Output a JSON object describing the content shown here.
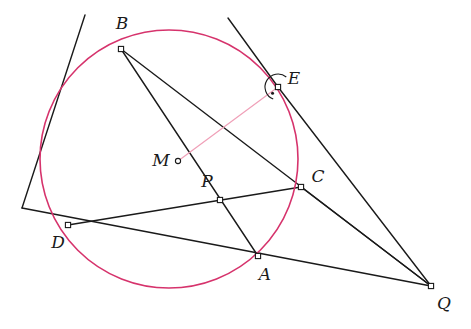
{
  "figure": {
    "kind": "euclidean-geometry-diagram",
    "width": 471,
    "height": 329,
    "background_color": "#ffffff"
  },
  "colors": {
    "circle_stroke": "#d6336c",
    "line_stroke": "#1a1a1a",
    "highlight_stroke": "#f0a0b8",
    "label_color": "#1a1a1a",
    "marker_fill": "#ffffff"
  },
  "circle": {
    "name": "main-circle",
    "cx": 169,
    "cy": 159,
    "r": 129,
    "stroke_width": 1.6
  },
  "points": [
    {
      "id": "B",
      "label": "B",
      "x": 121,
      "y": 49,
      "label_x": 122,
      "label_y": 24,
      "marker": "square-open"
    },
    {
      "id": "E",
      "label": "E",
      "x": 278,
      "y": 87,
      "label_x": 294,
      "label_y": 79,
      "marker": "square-open"
    },
    {
      "id": "C",
      "label": "C",
      "x": 301,
      "y": 187,
      "label_x": 318,
      "label_y": 177,
      "marker": "square-open"
    },
    {
      "id": "P",
      "label": "P",
      "x": 220,
      "y": 200,
      "label_x": 207,
      "label_y": 182,
      "marker": "square-open"
    },
    {
      "id": "M",
      "label": "M",
      "x": 178,
      "y": 161,
      "label_x": 161,
      "label_y": 161,
      "marker": "circle-open"
    },
    {
      "id": "D",
      "label": "D",
      "x": 68,
      "y": 225,
      "label_x": 58,
      "label_y": 243,
      "marker": "square-open"
    },
    {
      "id": "A",
      "label": "A",
      "x": 258,
      "y": 256,
      "label_x": 265,
      "label_y": 275,
      "marker": "square-open"
    },
    {
      "id": "Q",
      "label": "Q",
      "x": 431,
      "y": 286,
      "label_x": 444,
      "label_y": 304,
      "marker": "square-open"
    }
  ],
  "segments": [
    {
      "name": "line-tangent-through-B-and-D",
      "from": [
        85,
        15
      ],
      "to": [
        22,
        208
      ],
      "style": "solid-black",
      "note": "line entering top-left through B"
    },
    {
      "name": "line-B-to-Q-through-E",
      "from": [
        121,
        49
      ],
      "to": [
        431,
        286
      ],
      "style": "solid-black"
    },
    {
      "name": "line-B-to-A",
      "from": [
        121,
        49
      ],
      "to": [
        258,
        256
      ],
      "style": "solid-black"
    },
    {
      "name": "line-E-upper-extension",
      "from": [
        228,
        18
      ],
      "to": [
        278,
        87
      ],
      "style": "solid-black"
    },
    {
      "name": "line-E-to-Q",
      "from": [
        278,
        87
      ],
      "to": [
        431,
        286
      ],
      "style": "solid-black"
    },
    {
      "name": "line-D-to-C-through-P",
      "from": [
        68,
        225
      ],
      "to": [
        301,
        187
      ],
      "style": "solid-black"
    },
    {
      "name": "line-D-to-Q-through-A",
      "from": [
        22,
        208
      ],
      "to": [
        431,
        286
      ],
      "style": "solid-black"
    },
    {
      "name": "line-C-to-Q",
      "from": [
        301,
        187
      ],
      "to": [
        431,
        286
      ],
      "style": "solid-black"
    },
    {
      "name": "segment-M-to-E",
      "from": [
        178,
        161
      ],
      "to": [
        278,
        87
      ],
      "style": "solid-pink",
      "note": "radius to tangency point"
    }
  ],
  "angle_markers": [
    {
      "name": "right-angle-at-E",
      "vertex": [
        278,
        87
      ],
      "radius": 13,
      "kind": "arc-with-center-dot",
      "note": "perpendicularity of radius ME and tangent line at E"
    }
  ],
  "labels": {
    "B": "B",
    "E": "E",
    "C": "C",
    "P": "P",
    "M": "M",
    "D": "D",
    "A": "A",
    "Q": "Q"
  }
}
